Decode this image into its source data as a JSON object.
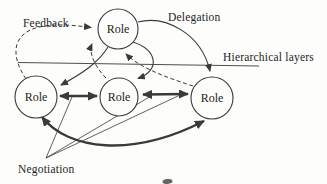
{
  "diagram": {
    "type": "node-link-diagram",
    "colors": {
      "background": "#fdfdfb",
      "ink": "#3a3a3a",
      "text": "#242424"
    },
    "nodes": [
      {
        "id": "role-top",
        "label": "Role",
        "layer": "upper"
      },
      {
        "id": "role-left",
        "label": "Role",
        "layer": "lower"
      },
      {
        "id": "role-middle",
        "label": "Role",
        "layer": "lower"
      },
      {
        "id": "role-right",
        "label": "Role",
        "layer": "lower"
      }
    ],
    "labels": {
      "feedback": "Feedback",
      "delegation": "Delegation",
      "hierarchical_layers": "Hierarchical layers",
      "negotiation": "Negotiation"
    },
    "edges": [
      {
        "type": "feedback",
        "style": "dashed-arrow",
        "from": "role-left",
        "to": "role-top"
      },
      {
        "type": "feedback",
        "style": "dashed-arrow",
        "from": "role-middle",
        "to": "role-top"
      },
      {
        "type": "feedback",
        "style": "dashed-arrow",
        "from": "role-right",
        "to": "role-top"
      },
      {
        "type": "delegation",
        "style": "solid-arrow",
        "from": "role-top",
        "to": "role-left"
      },
      {
        "type": "delegation",
        "style": "solid-arrow",
        "from": "role-top",
        "to": "role-middle"
      },
      {
        "type": "delegation",
        "style": "solid-arrow",
        "from": "role-top",
        "to": "role-right"
      },
      {
        "type": "negotiation",
        "style": "thick-double-arrow",
        "from": "role-left",
        "to": "role-middle"
      },
      {
        "type": "negotiation",
        "style": "thick-double-arrow",
        "from": "role-middle",
        "to": "role-right"
      },
      {
        "type": "negotiation",
        "style": "thick-double-arrow",
        "from": "role-left",
        "to": "role-right"
      },
      {
        "type": "layer-separator",
        "style": "thin-line",
        "from": "",
        "to": ""
      }
    ]
  }
}
